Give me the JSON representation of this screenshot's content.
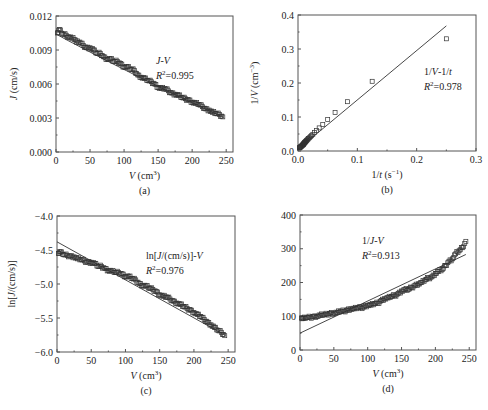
{
  "chart_data": [
    {
      "id": "a",
      "type": "scatter",
      "panel_label": "(a)",
      "xlabel": "V (cm³)",
      "ylabel": "J (cm/s)",
      "xlim": [
        0,
        260
      ],
      "ylim": [
        0,
        0.012
      ],
      "xticks": [
        0,
        50,
        100,
        150,
        200,
        250
      ],
      "yticks": [
        0.0,
        0.003,
        0.006,
        0.009,
        0.012
      ],
      "ytick_labels": [
        "0.000",
        "0.003",
        "0.006",
        "0.009",
        "0.012"
      ],
      "xtick_labels": [
        "0",
        "50",
        "100",
        "150",
        "200",
        "250"
      ],
      "annotation": [
        "J-V",
        "R²=0.995"
      ],
      "frame": [
        56,
        16,
        233,
        152
      ],
      "fit_line": {
        "x": [
          0,
          245
        ],
        "y": [
          0.0104,
          0.0031
        ],
        "type": "poly"
      },
      "series": [
        {
          "name": "data",
          "marker": "square-open",
          "x": [
            2,
            5,
            10,
            15,
            20,
            25,
            30,
            35,
            40,
            45,
            50,
            55,
            60,
            65,
            70,
            75,
            80,
            85,
            90,
            95,
            100,
            105,
            110,
            115,
            120,
            125,
            130,
            135,
            140,
            145,
            150,
            155,
            160,
            165,
            170,
            175,
            180,
            185,
            190,
            195,
            200,
            205,
            210,
            215,
            220,
            225,
            230,
            235,
            240,
            245
          ],
          "y": [
            0.0105,
            0.0108,
            0.0104,
            0.0103,
            0.0101,
            0.0101,
            0.0097,
            0.0097,
            0.0094,
            0.0092,
            0.0092,
            0.009,
            0.0087,
            0.0087,
            0.0084,
            0.0082,
            0.0082,
            0.008,
            0.008,
            0.0078,
            0.0075,
            0.0075,
            0.0073,
            0.0072,
            0.0068,
            0.0066,
            0.0065,
            0.0063,
            0.0062,
            0.006,
            0.0057,
            0.0056,
            0.0056,
            0.0054,
            0.0052,
            0.0051,
            0.005,
            0.0048,
            0.0047,
            0.0046,
            0.0044,
            0.0043,
            0.0042,
            0.004,
            0.0038,
            0.0037,
            0.0035,
            0.0034,
            0.0033,
            0.0031
          ]
        }
      ]
    },
    {
      "id": "b",
      "type": "scatter",
      "panel_label": "(b)",
      "xlabel": "1/t (s⁻¹)",
      "ylabel": "1/V (cm⁻³)",
      "xlim": [
        0,
        0.3
      ],
      "ylim": [
        0,
        0.4
      ],
      "xticks": [
        0.0,
        0.1,
        0.2,
        0.3
      ],
      "yticks": [
        0.0,
        0.1,
        0.2,
        0.3,
        0.4
      ],
      "xtick_labels": [
        "0.0",
        "0.1",
        "0.2",
        "0.3"
      ],
      "ytick_labels": [
        "0.0",
        "0.1",
        "0.2",
        "0.3",
        "0.4"
      ],
      "annotation": [
        "1/V-1/t",
        "R²=0.978"
      ],
      "frame": [
        298,
        15,
        476,
        151
      ],
      "fit_line": {
        "x": [
          0,
          0.25
        ],
        "y": [
          0.005,
          0.368
        ],
        "type": "linear"
      },
      "series": [
        {
          "name": "data",
          "marker": "square-open",
          "x": [
            0.25,
            0.125,
            0.0833,
            0.0625,
            0.05,
            0.0417,
            0.0357,
            0.0313,
            0.0278,
            0.025,
            0.0227,
            0.0208,
            0.0192,
            0.0179,
            0.0167,
            0.0156,
            0.0147,
            0.0139,
            0.0132,
            0.0125,
            0.0119,
            0.0114,
            0.0109,
            0.0104,
            0.01,
            0.0096,
            0.0093,
            0.0089,
            0.0086,
            0.0083,
            0.0078,
            0.0071,
            0.0063,
            0.0056,
            0.005,
            0.0042,
            0.0036,
            0.0031,
            0.0028,
            0.0025
          ],
          "y": [
            0.33,
            0.205,
            0.145,
            0.113,
            0.093,
            0.078,
            0.068,
            0.06,
            0.054,
            0.049,
            0.045,
            0.042,
            0.039,
            0.037,
            0.035,
            0.033,
            0.031,
            0.03,
            0.028,
            0.027,
            0.026,
            0.025,
            0.024,
            0.023,
            0.022,
            0.021,
            0.02,
            0.019,
            0.019,
            0.018,
            0.017,
            0.016,
            0.015,
            0.014,
            0.013,
            0.012,
            0.011,
            0.01,
            0.0095,
            0.009
          ]
        }
      ]
    },
    {
      "id": "c",
      "type": "scatter",
      "panel_label": "(c)",
      "xlabel": "V (cm³)",
      "ylabel": "ln[J/(cm/s)]",
      "xlim": [
        0,
        260
      ],
      "ylim": [
        -6.0,
        -4.0
      ],
      "xticks": [
        0,
        50,
        100,
        150,
        200,
        250
      ],
      "yticks": [
        -6.0,
        -5.5,
        -5.0,
        -4.5,
        -4.0
      ],
      "xtick_labels": [
        "0",
        "50",
        "100",
        "150",
        "200",
        "250"
      ],
      "ytick_labels": [
        "-6.0",
        "-5.5",
        "-5.0",
        "-4.5",
        "-4.0"
      ],
      "annotation": [
        "ln[J/(cm/s)]-V",
        "R²=0.976"
      ],
      "frame": [
        57,
        216,
        235,
        352
      ],
      "fit_line": {
        "x": [
          0,
          245
        ],
        "y": [
          -4.38,
          -5.75
        ],
        "type": "linear"
      },
      "series": [
        {
          "name": "data",
          "marker": "square-open",
          "x": [
            2,
            5,
            10,
            15,
            20,
            25,
            30,
            35,
            40,
            45,
            50,
            55,
            60,
            65,
            70,
            75,
            80,
            85,
            90,
            95,
            100,
            105,
            110,
            115,
            120,
            125,
            130,
            135,
            140,
            145,
            150,
            155,
            160,
            165,
            170,
            175,
            180,
            185,
            190,
            195,
            200,
            205,
            210,
            215,
            220,
            225,
            230,
            235,
            240,
            245
          ],
          "y": [
            -4.55,
            -4.53,
            -4.57,
            -4.58,
            -4.59,
            -4.6,
            -4.63,
            -4.64,
            -4.66,
            -4.68,
            -4.68,
            -4.7,
            -4.74,
            -4.74,
            -4.77,
            -4.8,
            -4.81,
            -4.83,
            -4.83,
            -4.85,
            -4.89,
            -4.89,
            -4.92,
            -4.94,
            -4.99,
            -5.02,
            -5.03,
            -5.06,
            -5.08,
            -5.11,
            -5.16,
            -5.18,
            -5.19,
            -5.22,
            -5.25,
            -5.28,
            -5.3,
            -5.33,
            -5.36,
            -5.38,
            -5.42,
            -5.45,
            -5.48,
            -5.52,
            -5.56,
            -5.6,
            -5.64,
            -5.68,
            -5.71,
            -5.76
          ]
        }
      ]
    },
    {
      "id": "d",
      "type": "scatter",
      "panel_label": "(d)",
      "xlabel": "V (cm³)",
      "ylabel": "",
      "xlim": [
        0,
        260
      ],
      "ylim": [
        0,
        400
      ],
      "xticks": [
        0,
        50,
        100,
        150,
        200,
        250
      ],
      "yticks": [
        0,
        100,
        200,
        300,
        400
      ],
      "xtick_labels": [
        "0",
        "50",
        "100",
        "150",
        "200",
        "250"
      ],
      "ytick_labels": [
        "0",
        "100",
        "200",
        "300",
        "400"
      ],
      "annotation": [
        "1/J-V",
        "R²=0.913"
      ],
      "frame": [
        300,
        215,
        476,
        350
      ],
      "fit_line": {
        "x": [
          0,
          245
        ],
        "y": [
          50,
          283
        ],
        "type": "linear"
      },
      "series": [
        {
          "name": "data",
          "marker": "square-open",
          "x": [
            2,
            5,
            10,
            15,
            20,
            25,
            30,
            35,
            40,
            45,
            50,
            55,
            60,
            65,
            70,
            75,
            80,
            85,
            90,
            95,
            100,
            105,
            110,
            115,
            120,
            125,
            130,
            135,
            140,
            145,
            150,
            155,
            160,
            165,
            170,
            175,
            180,
            185,
            190,
            195,
            200,
            205,
            210,
            215,
            220,
            225,
            230,
            235,
            240,
            245
          ],
          "y": [
            95,
            93,
            96,
            97,
            99,
            100,
            103,
            104,
            106,
            109,
            109,
            111,
            115,
            115,
            119,
            122,
            122,
            125,
            125,
            128,
            133,
            133,
            137,
            139,
            147,
            152,
            154,
            159,
            161,
            167,
            175,
            178,
            179,
            185,
            192,
            196,
            200,
            208,
            213,
            217,
            227,
            233,
            238,
            250,
            263,
            270,
            285,
            294,
            303,
            322
          ]
        }
      ]
    }
  ]
}
